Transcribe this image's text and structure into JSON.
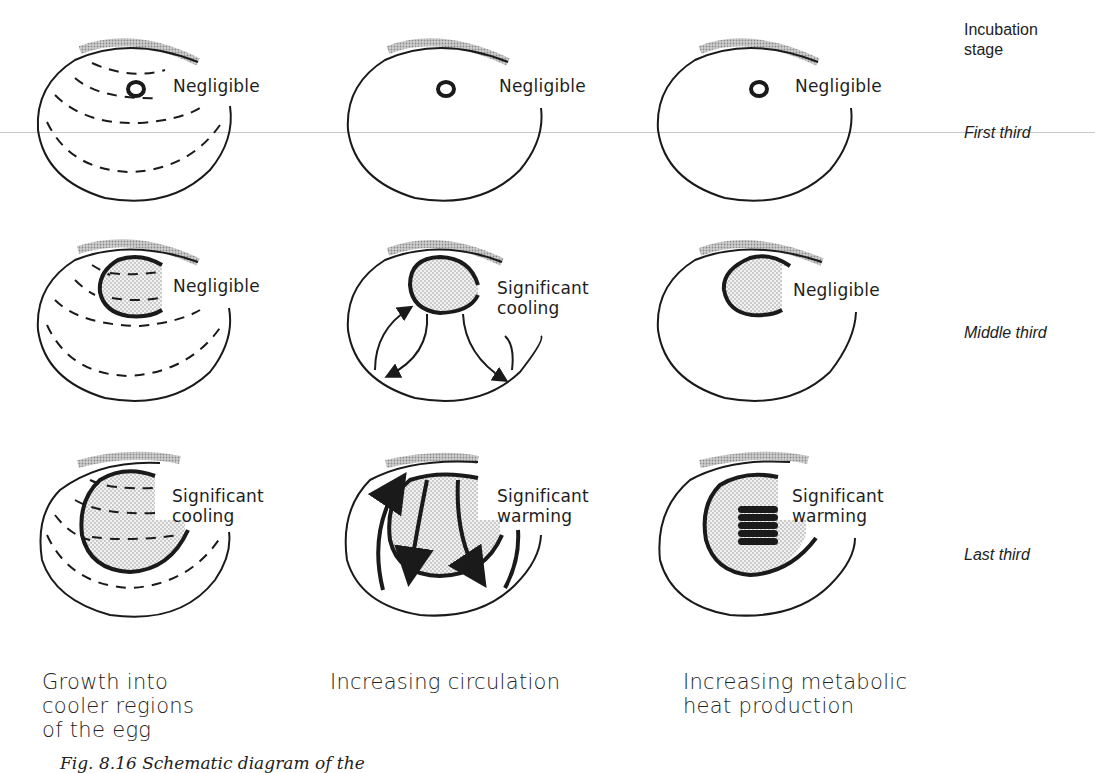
{
  "figure": {
    "stage_header": "Incubation stage",
    "stages": [
      "First third",
      "Middle third",
      "Last third"
    ],
    "columns": [
      {
        "caption": "Growth into\ncooler regions\nof the egg"
      },
      {
        "caption": "Increasing circulation"
      },
      {
        "caption": "Increasing metabolic\nheat production"
      }
    ],
    "panels": [
      [
        {
          "label": "Negligible"
        },
        {
          "label": "Negligible"
        },
        {
          "label": "Negligible"
        }
      ],
      [
        {
          "label": "Negligible"
        },
        {
          "label": "Significant\ncooling"
        },
        {
          "label": "Negligible"
        }
      ],
      [
        {
          "label": "Significant\ncooling"
        },
        {
          "label": "Significant\nwarming"
        },
        {
          "label": "Significant\nwarming"
        }
      ]
    ],
    "caption": "Fig. 8.16   Schematic diagram of the",
    "colors": {
      "ink": "#1a1a1a",
      "stipple": "#d9d9d9",
      "shell_shade": "#b5b5b5"
    }
  }
}
